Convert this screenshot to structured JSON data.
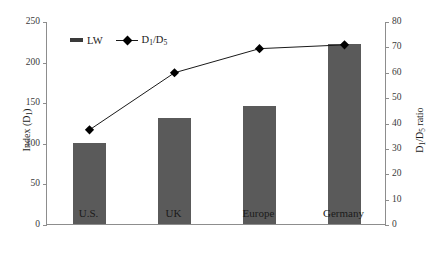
{
  "chart_data": {
    "type": "bar",
    "title": "",
    "categories": [
      "U.S.",
      "UK",
      "Europe",
      "Germany"
    ],
    "xlabel": "",
    "series": [
      {
        "name": "LW",
        "type": "bar",
        "axis": "left",
        "values": [
          100,
          131,
          145,
          222
        ]
      },
      {
        "name": "D1/D5",
        "type": "line",
        "axis": "right",
        "marker": "diamond",
        "values": [
          37.5,
          60,
          69.5,
          71
        ]
      }
    ],
    "left_axis": {
      "label": "Index (D1)",
      "label_parts": {
        "pre": "Index (D",
        "sub": "1",
        "post": ")"
      },
      "ylim": [
        0,
        250
      ],
      "ticks": [
        0,
        50,
        100,
        150,
        200,
        250
      ],
      "ticklabels": [
        "0",
        "50",
        "100",
        "150",
        "200",
        "250"
      ]
    },
    "right_axis": {
      "label": "D1/D5 ratio",
      "label_parts": {
        "pre": "D",
        "sub1": "1",
        "mid": "/D",
        "sub2": "5",
        "post": " ratio"
      },
      "ylim": [
        0,
        80
      ],
      "ticks": [
        0,
        10,
        20,
        30,
        40,
        50,
        60,
        70,
        80
      ],
      "ticklabels": [
        "0",
        "10",
        "20",
        "30",
        "40",
        "50",
        "60",
        "70",
        "80"
      ]
    },
    "grid": false,
    "legend_position": "upper-left-inside",
    "legend": [
      {
        "label": "LW",
        "marker": "bar"
      },
      {
        "label": "D1/D5",
        "marker": "line-diamond"
      }
    ],
    "colors": {
      "bar": "#5a5a5a",
      "line": "#1a1a1a",
      "marker": "#000000",
      "axis": "#8d8d8d"
    }
  },
  "legend": {
    "bar_label": "LW",
    "line_label_pre": "D",
    "line_label_sub1": "1",
    "line_label_mid": "/D",
    "line_label_sub2": "5"
  },
  "axes": {
    "left_title_pre": "Index (D",
    "left_title_sub": "1",
    "left_title_post": ")",
    "right_title_pre": "D",
    "right_title_sub1": "1",
    "right_title_mid": "/D",
    "right_title_sub2": "5",
    "right_title_post": " ratio"
  }
}
